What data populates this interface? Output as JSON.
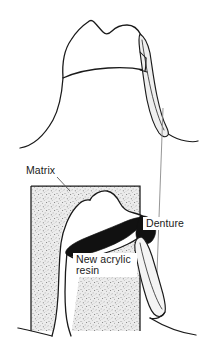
{
  "figure": {
    "type": "line-illustration",
    "width": 215,
    "height": 344,
    "background_color": "#ffffff",
    "ink_color": "#1a1a1a",
    "panels": [
      {
        "name": "upper-panel",
        "description": "Tooth with denture clasp arm seen from outside, no matrix",
        "region": {
          "x": 0,
          "y": 0,
          "width": 215,
          "height": 160
        }
      },
      {
        "name": "lower-panel",
        "description": "Sectional view showing stippled matrix block, tooth, black new acrylic resin band and denture clasp",
        "region": {
          "x": 0,
          "y": 160,
          "width": 215,
          "height": 184
        }
      }
    ],
    "labels": [
      {
        "id": "matrix",
        "text": "Matrix",
        "x": 26,
        "y": 174,
        "anchor": "start",
        "leader": {
          "from_x": 56,
          "from_y": 177,
          "to_x": 70,
          "to_y": 190
        }
      },
      {
        "id": "denture",
        "text": "Denture",
        "x": 146,
        "y": 227,
        "anchor": "start",
        "leader": {
          "from_x": 163,
          "from_y": 108,
          "to_x": 156,
          "to_y": 300
        }
      },
      {
        "id": "new-acrylic-resin-line1",
        "text": "New acrylic",
        "x": 76,
        "y": 263,
        "anchor": "start"
      },
      {
        "id": "new-acrylic-resin-line2",
        "text": "resin",
        "x": 76,
        "y": 274,
        "anchor": "start"
      }
    ],
    "colors": {
      "outline": "#1a1a1a",
      "matrix_fill": "#e8e8e8",
      "matrix_stipple": "#707070",
      "resin_fill": "#111111",
      "clasp_fill": "#efefef",
      "paper": "#ffffff"
    },
    "legend_notes": [
      "Matrix is rendered as a stippled rectangular block",
      "New acrylic resin is the solid black band",
      "Denture clasp arm is the light tapered sliver"
    ]
  }
}
